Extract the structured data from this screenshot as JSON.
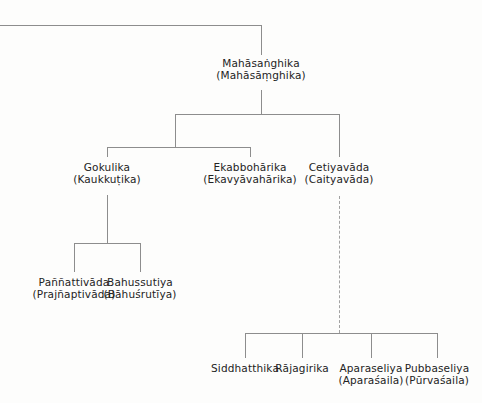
{
  "diagram": {
    "line_color": "#8d8d8d",
    "dashed_line_color": "#a2a2a2",
    "text_color": "#232323",
    "background_color": "#fdfdfc",
    "nodes": {
      "root": {
        "pali": "Mahāsaṅghika",
        "skt": "(Mahāsāṃghika)"
      },
      "gokulika": {
        "pali": "Gokulika",
        "skt": "(Kaukkuṭika)"
      },
      "ekabboharika": {
        "pali": "Ekabbohārika",
        "skt": "(Ekavyāvahārika)"
      },
      "cetiyavada": {
        "pali": "Cetiyavāda",
        "skt": "(Caityavāda)"
      },
      "pannattivada": {
        "pali": "Paññattivāda",
        "skt": "(Prajñaptivāda)"
      },
      "bahussutiya": {
        "pali": "Bahussutiya",
        "skt": "(Bāhuśrutīya)"
      },
      "siddhatthika": {
        "pali": "Siddhatthika",
        "skt": ""
      },
      "rajagirika": {
        "pali": "Rājagirika",
        "skt": ""
      },
      "aparaseliya": {
        "pali": "Aparaseliya",
        "skt": "(Aparaśaila)"
      },
      "pubbaseliya": {
        "pali": "Pubbaseliya",
        "skt": "(Pūrvaśaila)"
      }
    }
  }
}
